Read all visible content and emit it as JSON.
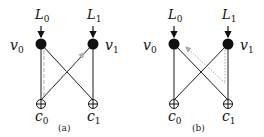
{
  "panels": [
    {
      "caption": "(a)",
      "inputs": [
        {
          "label": "L",
          "sub": "0"
        },
        {
          "label": "L",
          "sub": "1"
        }
      ],
      "variable_nodes": [
        {
          "label": "v",
          "sub": "0"
        },
        {
          "label": "v",
          "sub": "1"
        }
      ],
      "check_nodes": [
        {
          "label": "c",
          "sub": "0"
        },
        {
          "label": "c",
          "sub": "1"
        }
      ],
      "edges": [
        "v0-c0",
        "v0-c1",
        "v1-c0",
        "v1-c1"
      ],
      "message_path": "dashed gray arrow from v0 down to c0, then up to v1"
    },
    {
      "caption": "(b)",
      "inputs": [
        {
          "label": "L",
          "sub": "0"
        },
        {
          "label": "L",
          "sub": "1"
        }
      ],
      "variable_nodes": [
        {
          "label": "v",
          "sub": "0"
        },
        {
          "label": "v",
          "sub": "1"
        }
      ],
      "check_nodes": [
        {
          "label": "c",
          "sub": "0"
        },
        {
          "label": "c",
          "sub": "1"
        }
      ],
      "edges": [
        "v0-c0",
        "v0-c1",
        "v1-c0",
        "v1-c1"
      ],
      "message_path": "dotted gray arrow from v1 down to c1, then up to v0"
    }
  ],
  "colors": {
    "edge": "#1a1a1a",
    "node": "#111111",
    "message": "#b0b0b0"
  }
}
